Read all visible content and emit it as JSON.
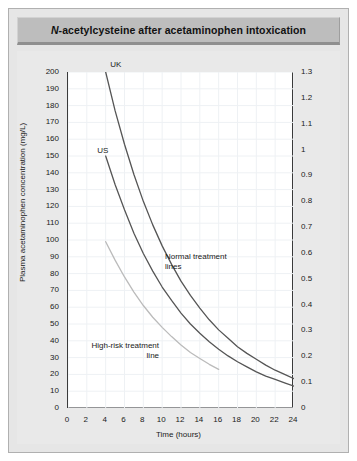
{
  "figure": {
    "title_prefix": "N",
    "title_rest": "-acetylcysteine after acetaminophen intoxication"
  },
  "chart_data": {
    "type": "line",
    "title": "N-acetylcysteine after acetaminophen intoxication",
    "xlabel": "Time (hours)",
    "ylabel": "Plasma acetaminophen concentration (mg/L)",
    "ylabel_right": "Plasma acetaminophen concentration (mmol/L)",
    "xlim": [
      0,
      24
    ],
    "ylim": [
      0,
      200
    ],
    "ylim_right": [
      0,
      1.3
    ],
    "grid": true,
    "legend_position": "inline-annotations",
    "x_ticks": [
      0,
      2,
      4,
      6,
      8,
      10,
      12,
      14,
      16,
      18,
      20,
      22,
      24
    ],
    "x_minor_tick_step": 1,
    "y_ticks_left": [
      0,
      10,
      20,
      30,
      40,
      50,
      60,
      70,
      80,
      90,
      100,
      110,
      120,
      130,
      140,
      150,
      160,
      170,
      180,
      190,
      200
    ],
    "y_ticks_right": [
      "0",
      "0.1",
      "0.2",
      "0.3",
      "0.4",
      "0.5",
      "0.6",
      "0.7",
      "0.8",
      "0.9",
      "1",
      "1.1",
      "1.2",
      "1.3"
    ],
    "series": [
      {
        "name": "UK",
        "label": "UK",
        "color": "#555555",
        "points": [
          [
            4,
            200
          ],
          [
            5,
            177
          ],
          [
            6,
            157
          ],
          [
            7,
            139
          ],
          [
            8,
            123
          ],
          [
            9,
            109
          ],
          [
            10,
            96.5
          ],
          [
            11,
            85.5
          ],
          [
            12,
            75.5
          ],
          [
            13,
            67
          ],
          [
            14,
            59.5
          ],
          [
            15,
            52.5
          ],
          [
            16,
            46.5
          ],
          [
            17,
            41.5
          ],
          [
            18,
            36.5
          ],
          [
            19,
            32.5
          ],
          [
            20,
            29
          ],
          [
            21,
            25.5
          ],
          [
            22,
            22.5
          ],
          [
            23,
            20
          ],
          [
            24,
            17.5
          ]
        ]
      },
      {
        "name": "US",
        "label": "US",
        "color": "#555555",
        "points": [
          [
            4,
            150
          ],
          [
            5,
            133
          ],
          [
            6,
            118
          ],
          [
            7,
            104
          ],
          [
            8,
            92
          ],
          [
            9,
            81.5
          ],
          [
            10,
            72
          ],
          [
            11,
            64
          ],
          [
            12,
            56.5
          ],
          [
            13,
            50
          ],
          [
            14,
            44.5
          ],
          [
            15,
            39.5
          ],
          [
            16,
            35
          ],
          [
            17,
            31
          ],
          [
            18,
            27.5
          ],
          [
            19,
            24.5
          ],
          [
            20,
            21.5
          ],
          [
            21,
            19
          ],
          [
            22,
            17
          ],
          [
            23,
            15
          ],
          [
            24,
            13
          ]
        ]
      },
      {
        "name": "high-risk",
        "label": "High-risk treatment line",
        "color": "#bbbbbb",
        "points": [
          [
            4,
            99
          ],
          [
            5,
            88
          ],
          [
            6,
            78
          ],
          [
            7,
            69
          ],
          [
            8,
            61
          ],
          [
            9,
            54
          ],
          [
            10,
            48
          ],
          [
            11,
            42.5
          ],
          [
            12,
            37.5
          ],
          [
            13,
            33
          ],
          [
            14,
            29.5
          ],
          [
            15,
            26
          ],
          [
            16,
            23
          ]
        ]
      }
    ],
    "annotations": [
      {
        "name": "uk-label",
        "text": "UK",
        "x": 4.6,
        "y": 207
      },
      {
        "name": "us-label",
        "text": "US",
        "x": 3.2,
        "y": 156
      },
      {
        "name": "normal-treatment-label",
        "line1": "Normal treatment",
        "line2": "lines",
        "x": 10.4,
        "y": 93
      },
      {
        "name": "high-risk-label",
        "line1": "High-risk treatment",
        "line2": "line",
        "x": 2.6,
        "y": 40
      }
    ]
  },
  "axes": {
    "x_label": "Time (hours)",
    "y_left_label": "Plasma acetaminophen concentration (mg/L)",
    "y_right_label": "Plasma acetaminophen concentration (mmol/L)"
  },
  "annotations": {
    "uk": "UK",
    "us": "US",
    "normal_line1": "Normal treatment",
    "normal_line2": "lines",
    "highrisk_line1": "High-risk treatment",
    "highrisk_line2": "line"
  },
  "colors": {
    "page_background": "#ffffff",
    "panel_background": "#e9e9e9",
    "title_background": "#bdbdbd",
    "plot_background": "#ffffff",
    "axis": "#3a3a3a",
    "grid": "#eef1f4",
    "normal_line": "#555555",
    "highrisk_line": "#bbbbbb",
    "text": "#1a1a1a"
  }
}
